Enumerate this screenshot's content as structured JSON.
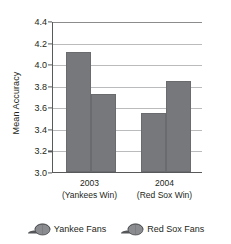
{
  "chart_data": {
    "type": "bar",
    "title": "",
    "xlabel": "",
    "ylabel": "Mean Accuracy",
    "ylim": [
      3.0,
      4.4
    ],
    "ytick_step": 0.2,
    "yticks": [
      "4.4",
      "4.2",
      "4.0",
      "3.8",
      "3.6",
      "3.4",
      "3.2",
      "3.0"
    ],
    "grid": true,
    "legend_position": "bottom",
    "categories": [
      "2003",
      "2004"
    ],
    "category_sublabels": [
      "(Yankees Win)",
      "(Red Sox Win)"
    ],
    "series": [
      {
        "name": "Yankee Fans",
        "values": [
          4.11,
          3.55
        ],
        "color": "#77787b"
      },
      {
        "name": "Red Sox Fans",
        "values": [
          3.72,
          3.84
        ],
        "color": "#77787b"
      }
    ]
  },
  "axis": {
    "y_title": "Mean Accuracy"
  },
  "legend": {
    "items": [
      {
        "label": "Yankee Fans",
        "icon": "baseball-cap-icon"
      },
      {
        "label": "Red Sox Fans",
        "icon": "baseball-cap-icon"
      }
    ]
  }
}
